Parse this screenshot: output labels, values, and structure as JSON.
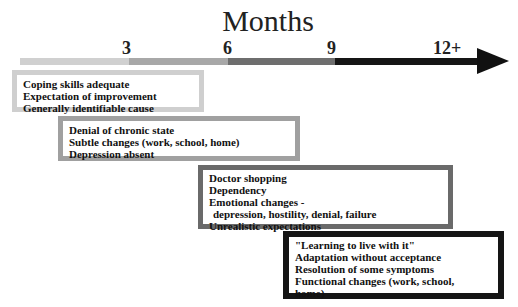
{
  "title": "Months",
  "ticks": [
    "3",
    "6",
    "9",
    "12+"
  ],
  "timeline_colors": [
    "#d0d0d0",
    "#a8a8a8",
    "#6e6e6e",
    "#151515"
  ],
  "phases": [
    {
      "lines": [
        "Coping skills adequate",
        "Expectation of improvement",
        "Generally identifiable cause"
      ],
      "border": "#cfcfcf"
    },
    {
      "lines": [
        "Denial of chronic state",
        "Subtle changes (work, school, home)",
        "Depression absent"
      ],
      "border": "#a0a0a0"
    },
    {
      "lines": [
        "Doctor shopping",
        "Dependency",
        "Emotional changes -",
        "  depression, hostility, denial, failure",
        "Unrealistic expectations"
      ],
      "border": "#6a6a6a"
    },
    {
      "lines": [
        "\"Learning to live with it\"",
        "Adaptation without acceptance",
        "Resolution of some symptoms",
        "Functional changes (work, school,",
        "home)"
      ],
      "border": "#151515"
    }
  ]
}
